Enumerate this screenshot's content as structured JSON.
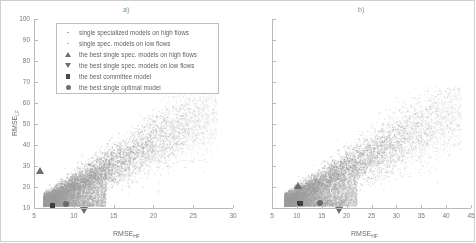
{
  "figure": {
    "background": "#ffffff",
    "point_color": "#9e9e9e",
    "marker_color": "#6b6b6b",
    "axis_color": "#b9b9b9"
  },
  "panels": [
    {
      "id": "a",
      "label": "a)",
      "xlabel_main": "RMSE",
      "xlabel_sub": "HF",
      "ylabel_main": "RMSE",
      "ylabel_sub": "LF",
      "xlim": [
        5,
        30
      ],
      "ylim": [
        10,
        100
      ],
      "xticks": [
        5,
        10,
        15,
        20,
        25,
        30
      ],
      "xticklabels": [
        "5",
        "10",
        "15",
        "20",
        "25",
        "30"
      ],
      "yticks": [
        10,
        20,
        30,
        40,
        50,
        60,
        70,
        80,
        90,
        100
      ],
      "yticklabels": [
        "10",
        "20",
        "30",
        "40",
        "50",
        "60",
        "70",
        "80",
        "90",
        "100"
      ],
      "show_yticklabels": true
    },
    {
      "id": "b",
      "label": "b)",
      "xlabel_main": "RMSE",
      "xlabel_sub": "HF",
      "ylabel_main": "",
      "ylabel_sub": "",
      "xlim": [
        5,
        45
      ],
      "ylim": [
        10,
        100
      ],
      "xticks": [
        5,
        10,
        15,
        20,
        25,
        30,
        35,
        40,
        45
      ],
      "xticklabels": [
        "5",
        "10",
        "15",
        "20",
        "25",
        "30",
        "35",
        "40",
        "45"
      ],
      "yticks": [
        10,
        20,
        30,
        40,
        50,
        60,
        70,
        80,
        90,
        100
      ],
      "yticklabels": [
        "",
        "",
        "",
        "",
        "",
        "",
        "",
        "",
        "",
        ""
      ],
      "show_yticklabels": false
    }
  ],
  "legend": {
    "items": [
      {
        "marker": "small-dot-icon",
        "label": "single specialized  models on high flows"
      },
      {
        "marker": "small-dot-light-icon",
        "label": "single spec.  models on low flows"
      },
      {
        "marker": "triangle-up-icon",
        "label": "the best single spec.  models on high flows"
      },
      {
        "marker": "triangle-down-icon",
        "label": "the best single spec.  models on low flows"
      },
      {
        "marker": "square-icon",
        "label": "the best committee model"
      },
      {
        "marker": "circle-icon",
        "label": "the best single optimal model"
      }
    ]
  },
  "chart_data": {
    "type": "scatter",
    "title": "",
    "panel_count": 2,
    "panels": [
      {
        "name": "a)",
        "xlabel": "RMSE_HF",
        "ylabel": "RMSE_LF",
        "xlim": [
          5,
          30
        ],
        "ylim": [
          10,
          100
        ],
        "grid": false,
        "cloud": {
          "name": "single specialized models",
          "n_points": 9000,
          "description": "dense elongated diagonal cloud",
          "x_range": [
            6.2,
            28.0
          ],
          "y_range": [
            11.0,
            62.0
          ],
          "core_x_range": [
            6.5,
            14.0
          ],
          "core_y_range": [
            11.0,
            22.0
          ],
          "slope": 2.25,
          "intercept": -4.0,
          "spread": 6.5
        },
        "markers": [
          {
            "name": "the best single spec. models on high flows",
            "shape": "triangle-up",
            "x": 5.8,
            "y": 26.0
          },
          {
            "name": "the best committee model",
            "shape": "square",
            "x": 7.3,
            "y": 11.0
          },
          {
            "name": "the best single optimal model",
            "shape": "circle",
            "x": 9.0,
            "y": 12.0
          },
          {
            "name": "the best single spec. models on low flows",
            "shape": "triangle-down",
            "x": 11.3,
            "y": 10.6
          }
        ]
      },
      {
        "name": "b)",
        "xlabel": "RMSE_HF",
        "ylabel": "",
        "xlim": [
          5,
          45
        ],
        "ylim": [
          10,
          100
        ],
        "grid": false,
        "cloud": {
          "name": "single specialized models",
          "n_points": 9000,
          "description": "dense elongated diagonal cloud",
          "x_range": [
            7.5,
            43.0
          ],
          "y_range": [
            11.0,
            62.0
          ],
          "core_x_range": [
            8.0,
            22.0
          ],
          "core_y_range": [
            11.0,
            22.0
          ],
          "slope": 1.35,
          "intercept": -0.5,
          "spread": 7.0
        },
        "markers": [
          {
            "name": "the best single spec. models on high flows",
            "shape": "triangle-up",
            "x": 10.3,
            "y": 19.0
          },
          {
            "name": "the best committee model",
            "shape": "square",
            "x": 10.6,
            "y": 12.2
          },
          {
            "name": "the best single optimal model",
            "shape": "circle",
            "x": 14.6,
            "y": 12.3
          },
          {
            "name": "the best single spec. models on low flows",
            "shape": "triangle-down",
            "x": 18.6,
            "y": 10.6
          }
        ]
      }
    ]
  }
}
